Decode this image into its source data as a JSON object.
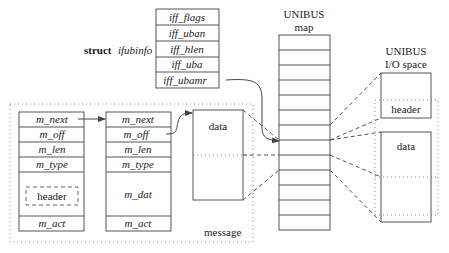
{
  "ifubinfo": {
    "label_struct": "struct",
    "label_name": "ifubinfo",
    "fields": [
      "iff_flags",
      "iff_uban",
      "iff_hlen",
      "iff_uba",
      "iff_ubamr"
    ]
  },
  "mbuf1": {
    "fields": [
      "m_next",
      "m_off",
      "m_len",
      "m_type"
    ],
    "header_label": "header",
    "act": "m_act"
  },
  "mbuf2": {
    "fields": [
      "m_next",
      "m_off",
      "m_len",
      "m_type"
    ],
    "dat": "m_dat",
    "act": "m_act"
  },
  "data_block": {
    "label": "data"
  },
  "message_label": "message",
  "unibus_map": {
    "title_line1": "UNIBUS",
    "title_line2": "map",
    "rows": 13
  },
  "io_space": {
    "title_line1": "UNIBUS",
    "title_line2": "I/O space",
    "header_label": "header",
    "data_label": "data"
  }
}
